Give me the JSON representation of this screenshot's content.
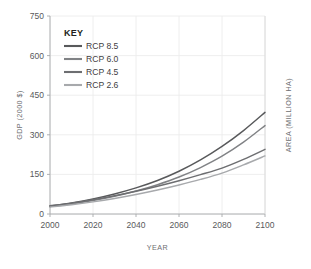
{
  "chart_data": {
    "type": "line",
    "title": "",
    "xlabel": "YEAR",
    "ylabel": "GDP (2000 $)",
    "y2label": "AREA (MILLION HA)",
    "xlim": [
      2000,
      2100
    ],
    "ylim": [
      0,
      750
    ],
    "grid": true,
    "legend_position": "top-left-inside",
    "legend_title": "KEY",
    "xticks": [
      "2000",
      "2020",
      "2040",
      "2060",
      "2080",
      "2100"
    ],
    "yticks": [
      "0",
      "150",
      "300",
      "450",
      "600",
      "750"
    ],
    "x": [
      2000,
      2010,
      2020,
      2030,
      2040,
      2050,
      2060,
      2070,
      2080,
      2090,
      2100
    ],
    "series": [
      {
        "name": "RCP 8.5",
        "color": "#58595b",
        "values": [
          30,
          42,
          57,
          76,
          99,
          127,
          162,
          205,
          256,
          316,
          385
        ]
      },
      {
        "name": "RCP 6.0",
        "color": "#808285",
        "values": [
          28,
          38,
          51,
          67,
          87,
          111,
          140,
          176,
          219,
          272,
          335
        ]
      },
      {
        "name": "RCP 4.5",
        "color": "#6d6e71",
        "values": [
          31,
          41,
          54,
          69,
          86,
          105,
          126,
          149,
          174,
          207,
          245
        ]
      },
      {
        "name": "RCP 2.6",
        "color": "#a7a9ac",
        "values": [
          26,
          35,
          46,
          59,
          74,
          91,
          110,
          131,
          155,
          186,
          220
        ]
      }
    ]
  },
  "colors": {
    "gridline": "#ececec",
    "axis": "#a7a9ac",
    "tick_text": "#58595b",
    "axis_title": "#6d6e71",
    "legend_title": "#231f20",
    "legend_label": "#414042",
    "background": "#ffffff"
  }
}
